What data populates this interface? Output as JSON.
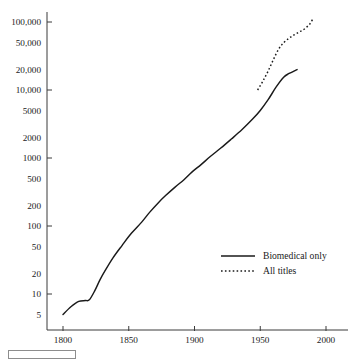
{
  "chart_data": {
    "type": "line",
    "title": "",
    "subtitle": "",
    "xlabel": "",
    "ylabel": "",
    "xscale": "linear",
    "yscale": "log",
    "xlim": [
      1795,
      2005
    ],
    "ylim": [
      4.2,
      130000
    ],
    "grid": false,
    "legend_position": "inside-lower-right",
    "xticks": [
      1800,
      1850,
      1900,
      1950,
      2000
    ],
    "xticklabels": [
      "1800",
      "1850",
      "1900",
      "1950",
      "2000"
    ],
    "yticks": [
      5,
      10,
      20,
      50,
      100,
      200,
      500,
      1000,
      2000,
      5000,
      10000,
      20000,
      50000,
      100000
    ],
    "yticklabels": [
      "5",
      "10",
      "20",
      "50",
      "100",
      "200",
      "500",
      "1000",
      "2000",
      "5000",
      "10,000",
      "20,000",
      "50,000",
      "100,000"
    ],
    "ymajorticks": [
      10,
      100,
      1000,
      10000,
      100000
    ],
    "series": [
      {
        "name": "Biomedical only",
        "style": "solid",
        "color": "#1a1a1a",
        "x": [
          1800,
          1806,
          1812,
          1817,
          1820,
          1824,
          1828,
          1832,
          1838,
          1845,
          1852,
          1860,
          1866,
          1872,
          1878,
          1885,
          1892,
          1898,
          1905,
          1912,
          1920,
          1928,
          1936,
          1944,
          1950,
          1956,
          1962,
          1968,
          1972,
          1978
        ],
        "y": [
          5,
          6.5,
          7.8,
          8.0,
          8.2,
          11,
          16,
          22,
          34,
          52,
          78,
          115,
          160,
          215,
          280,
          370,
          480,
          620,
          800,
          1050,
          1400,
          1900,
          2600,
          3700,
          5000,
          7200,
          11000,
          15500,
          17500,
          20000
        ]
      },
      {
        "name": "All titles",
        "style": "dotted",
        "color": "#1a1a1a",
        "x": [
          1948,
          1952,
          1956,
          1960,
          1964,
          1968,
          1972,
          1976,
          1980,
          1984,
          1988,
          1990
        ],
        "y": [
          10000,
          13500,
          19000,
          28000,
          40000,
          50000,
          58000,
          65000,
          72000,
          80000,
          95000,
          112000
        ]
      }
    ]
  },
  "legend": {
    "entries": [
      {
        "label": "Biomedical only",
        "style": "solid"
      },
      {
        "label": "All titles",
        "style": "dotted"
      }
    ]
  },
  "caption_box": {
    "text": ""
  }
}
